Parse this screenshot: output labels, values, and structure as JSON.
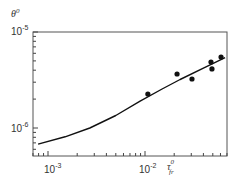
{
  "chart_data": {
    "type": "scatter",
    "title": "",
    "xlabel": "τ_fr^0",
    "ylabel": "θ^0",
    "xscale": "log",
    "yscale": "log",
    "xlim": [
      0.0007,
      0.07
    ],
    "ylim": [
      5.1e-07,
      1e-05
    ],
    "grid": false,
    "legend": null,
    "x_tick_labels": [
      "10^-3",
      "10^-2"
    ],
    "y_tick_labels": [
      "10^-6",
      "10^-5"
    ],
    "series": [
      {
        "name": "measured",
        "style": "markers",
        "color": "#111111",
        "x": [
          0.0107,
          0.0214,
          0.0305,
          0.0479,
          0.049,
          0.0608
        ],
        "y": [
          2.26e-06,
          3.65e-06,
          3.24e-06,
          4.87e-06,
          4.12e-06,
          5.49e-06
        ]
      },
      {
        "name": "model curve",
        "style": "line",
        "color": "#111111",
        "x": [
          0.00079,
          0.0015,
          0.0027,
          0.005,
          0.0089,
          0.015,
          0.023,
          0.04,
          0.067
        ],
        "y": [
          6.8e-07,
          8.1e-07,
          1e-06,
          1.35e-06,
          1.9e-06,
          2.55e-06,
          3.2e-06,
          4.2e-06,
          5.4e-06
        ]
      }
    ]
  },
  "labels": {
    "ylabel_base": "θ",
    "ylabel_sup": "0",
    "xlabel_base": "τ",
    "xlabel_sup": "0",
    "xlabel_sub": "fr",
    "ytick_top_base": "10",
    "ytick_top_exp": "-5",
    "ytick_mid_base": "10",
    "ytick_mid_exp": "-6",
    "xtick_1_base": "10",
    "xtick_1_exp": "-3",
    "xtick_2_base": "10",
    "xtick_2_exp": "-2"
  }
}
